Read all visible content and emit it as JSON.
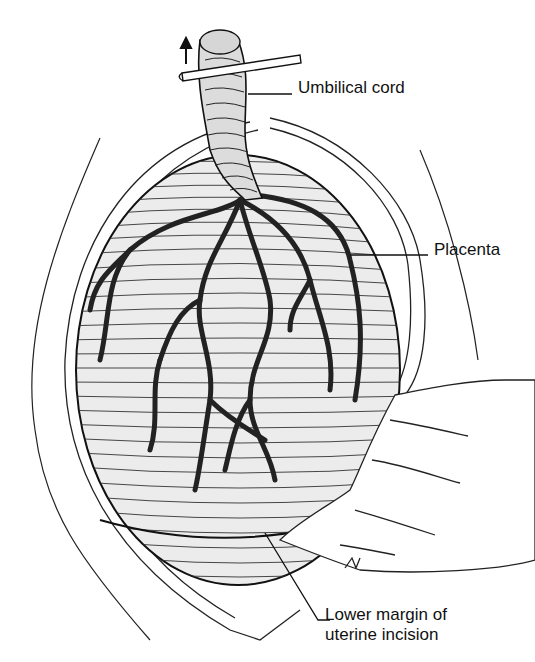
{
  "figure": {
    "type": "medical illustration",
    "labels": [
      {
        "id": "umbilical-cord",
        "text": "Umbilical cord"
      },
      {
        "id": "placenta",
        "text": "Placenta"
      },
      {
        "id": "lower-margin",
        "lines": [
          "Lower margin of",
          "uterine incision"
        ]
      }
    ],
    "annotations": {
      "arrow": "up-arrow (traction direction)",
      "instrument": "clamp"
    },
    "colors": {
      "ink": "#1a1a1a",
      "background": "#ffffff",
      "placenta_shade": "#e9e9e9"
    }
  }
}
